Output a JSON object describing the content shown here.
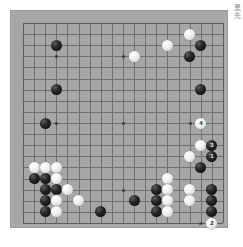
{
  "app": {
    "kind": "go-board-diagram",
    "board_size": 19
  },
  "board": {
    "background_color": "#a6a6a6",
    "line_color": "#6f6f6f",
    "star_points": [
      [
        3,
        3
      ],
      [
        9,
        3
      ],
      [
        15,
        3
      ],
      [
        3,
        9
      ],
      [
        9,
        9
      ],
      [
        15,
        9
      ],
      [
        3,
        15
      ],
      [
        9,
        15
      ],
      [
        15,
        15
      ]
    ]
  },
  "margin_text": "黑先",
  "markers": [
    {
      "name": "point-a",
      "label": "a",
      "col": 16,
      "row": 18
    }
  ],
  "stones": [
    {
      "color": "b",
      "col": 3,
      "row": 2,
      "label": ""
    },
    {
      "color": "b",
      "col": 3,
      "row": 6,
      "label": ""
    },
    {
      "color": "b",
      "col": 2,
      "row": 9,
      "label": ""
    },
    {
      "color": "w",
      "col": 10,
      "row": 3,
      "label": ""
    },
    {
      "color": "w",
      "col": 13,
      "row": 2,
      "label": ""
    },
    {
      "color": "w",
      "col": 15,
      "row": 1,
      "label": ""
    },
    {
      "color": "b",
      "col": 16,
      "row": 2,
      "label": ""
    },
    {
      "color": "b",
      "col": 15,
      "row": 3,
      "label": ""
    },
    {
      "color": "b",
      "col": 16,
      "row": 6,
      "label": ""
    },
    {
      "color": "w",
      "col": 16,
      "row": 9,
      "label": "4"
    },
    {
      "color": "w",
      "col": 16,
      "row": 11,
      "label": ""
    },
    {
      "color": "b",
      "col": 17,
      "row": 11,
      "label": "3"
    },
    {
      "color": "w",
      "col": 15,
      "row": 12,
      "label": ""
    },
    {
      "color": "b",
      "col": 17,
      "row": 12,
      "label": "1"
    },
    {
      "color": "b",
      "col": 16,
      "row": 13,
      "label": ""
    },
    {
      "color": "w",
      "col": 1,
      "row": 13,
      "label": ""
    },
    {
      "color": "w",
      "col": 2,
      "row": 13,
      "label": ""
    },
    {
      "color": "w",
      "col": 3,
      "row": 13,
      "label": ""
    },
    {
      "color": "b",
      "col": 1,
      "row": 14,
      "label": ""
    },
    {
      "color": "b",
      "col": 2,
      "row": 14,
      "label": ""
    },
    {
      "color": "w",
      "col": 3,
      "row": 14,
      "label": ""
    },
    {
      "color": "b",
      "col": 2,
      "row": 15,
      "label": ""
    },
    {
      "color": "b",
      "col": 3,
      "row": 15,
      "label": ""
    },
    {
      "color": "w",
      "col": 4,
      "row": 15,
      "label": ""
    },
    {
      "color": "b",
      "col": 2,
      "row": 16,
      "label": ""
    },
    {
      "color": "w",
      "col": 3,
      "row": 16,
      "label": ""
    },
    {
      "color": "w",
      "col": 5,
      "row": 16,
      "label": ""
    },
    {
      "color": "b",
      "col": 2,
      "row": 17,
      "label": ""
    },
    {
      "color": "w",
      "col": 3,
      "row": 17,
      "label": ""
    },
    {
      "color": "b",
      "col": 7,
      "row": 17,
      "label": ""
    },
    {
      "color": "b",
      "col": 10,
      "row": 16,
      "label": ""
    },
    {
      "color": "w",
      "col": 13,
      "row": 14,
      "label": ""
    },
    {
      "color": "b",
      "col": 12,
      "row": 15,
      "label": ""
    },
    {
      "color": "w",
      "col": 13,
      "row": 15,
      "label": ""
    },
    {
      "color": "w",
      "col": 15,
      "row": 15,
      "label": ""
    },
    {
      "color": "b",
      "col": 17,
      "row": 15,
      "label": ""
    },
    {
      "color": "b",
      "col": 12,
      "row": 16,
      "label": ""
    },
    {
      "color": "w",
      "col": 13,
      "row": 16,
      "label": ""
    },
    {
      "color": "w",
      "col": 15,
      "row": 16,
      "label": ""
    },
    {
      "color": "b",
      "col": 17,
      "row": 16,
      "label": ""
    },
    {
      "color": "b",
      "col": 12,
      "row": 17,
      "label": ""
    },
    {
      "color": "w",
      "col": 13,
      "row": 17,
      "label": ""
    },
    {
      "color": "b",
      "col": 17,
      "row": 17,
      "label": ""
    },
    {
      "color": "w",
      "col": 17,
      "row": 18,
      "label": "2"
    }
  ]
}
